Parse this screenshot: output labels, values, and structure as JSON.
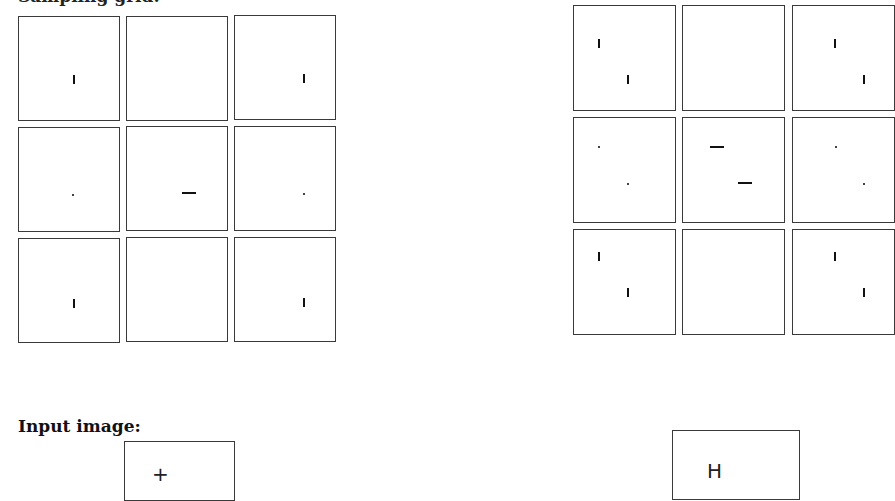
{
  "figure": {
    "top_caption_fragment": "Sampling grid:",
    "left_grid": {
      "rows": 3,
      "cols": 3,
      "cells": [
        {
          "mark": "vertical-bar",
          "x": 55,
          "y": 62
        },
        {
          "mark": "none"
        },
        {
          "mark": "vertical-bar",
          "x": 68,
          "y": 62
        },
        {
          "mark": "dot",
          "x": 55,
          "y": 68
        },
        {
          "mark": "horizontal-bar",
          "x": 55,
          "y": 67
        },
        {
          "mark": "dot",
          "x": 68,
          "y": 68
        },
        {
          "mark": "vertical-bar",
          "x": 55,
          "y": 61
        },
        {
          "mark": "none"
        },
        {
          "mark": "vertical-bar",
          "x": 68,
          "y": 61
        }
      ]
    },
    "right_grid": {
      "rows": 3,
      "cols": 3,
      "cells": [
        {
          "marks": [
            {
              "type": "vertical-bar",
              "x": 24,
              "y": 36
            },
            {
              "type": "vertical-bar",
              "x": 53,
              "y": 72
            }
          ]
        },
        {
          "marks": []
        },
        {
          "marks": [
            {
              "type": "vertical-bar",
              "x": 42,
              "y": 36
            },
            {
              "type": "vertical-bar",
              "x": 71,
              "y": 72
            }
          ]
        },
        {
          "marks": [
            {
              "type": "dot",
              "x": 25,
              "y": 29
            },
            {
              "type": "dot",
              "x": 53,
              "y": 66
            }
          ]
        },
        {
          "marks": [
            {
              "type": "horizontal-bar",
              "x": 27,
              "y": 28
            },
            {
              "type": "horizontal-bar",
              "x": 55,
              "y": 65
            }
          ]
        },
        {
          "marks": [
            {
              "type": "dot",
              "x": 43,
              "y": 29
            },
            {
              "type": "dot",
              "x": 71,
              "y": 66
            }
          ]
        },
        {
          "marks": [
            {
              "type": "vertical-bar",
              "x": 24,
              "y": 25
            },
            {
              "type": "vertical-bar",
              "x": 53,
              "y": 61
            }
          ]
        },
        {
          "marks": []
        },
        {
          "marks": [
            {
              "type": "vertical-bar",
              "x": 42,
              "y": 25
            },
            {
              "type": "vertical-bar",
              "x": 71,
              "y": 61
            }
          ]
        }
      ]
    },
    "input_label": "Input image:",
    "input_left_glyph": "+",
    "input_right_glyph": "H"
  }
}
